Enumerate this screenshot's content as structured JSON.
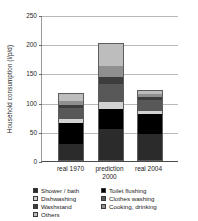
{
  "chart_data": {
    "type": "bar",
    "title": "",
    "subtitle": "",
    "xlabel": "",
    "ylabel": "Household consumption (l/p/d)",
    "categories": [
      "real 1970",
      "prediction 2000",
      "real 2004"
    ],
    "category_label_lines": [
      [
        "real 1970"
      ],
      [
        "prediction",
        "2000"
      ],
      [
        "real 2004"
      ]
    ],
    "ylim": [
      0,
      250
    ],
    "yticks": [
      0,
      50,
      100,
      150,
      200,
      250
    ],
    "ytick_labels": [
      "0",
      "50",
      "100",
      "150",
      "200",
      "250"
    ],
    "grid": true,
    "stacked": true,
    "legend_position": "bottom",
    "series": [
      {
        "name": "Shower / bath",
        "key": "shower",
        "color": "#2b2b2b",
        "values": [
          29,
          54,
          47
        ]
      },
      {
        "name": "Toilet flushing",
        "key": "toilet",
        "color": "#000000",
        "values": [
          36,
          35,
          34
        ]
      },
      {
        "name": "Dishwashing",
        "key": "dish",
        "color": "#d2d2d2",
        "values": [
          7,
          12,
          4
        ]
      },
      {
        "name": "Clothes washing",
        "key": "clothes",
        "color": "#585858",
        "values": [
          19,
          31,
          20
        ]
      },
      {
        "name": "Washstand",
        "key": "wash",
        "color": "#3d3d3d",
        "values": [
          5,
          12,
          5
        ]
      },
      {
        "name": "Cooking, drinking",
        "key": "cook",
        "color": "#8f8f8f",
        "values": [
          6,
          19,
          4
        ]
      },
      {
        "name": "Others",
        "key": "others",
        "color": "#bdbdbd",
        "values": [
          15,
          39,
          8
        ]
      }
    ],
    "totals": [
      117,
      202,
      122
    ]
  },
  "legend": {
    "column_left": [
      "Shower / bath",
      "Dishwashing",
      "Washstand",
      "Others"
    ],
    "column_right": [
      "Toilet flushing",
      "Clothes washing",
      "Cooking, drinking"
    ],
    "entries": [
      {
        "label": "Shower / bath",
        "key": "shower"
      },
      {
        "label": "Toilet flushing",
        "key": "toilet"
      },
      {
        "label": "Dishwashing",
        "key": "dish"
      },
      {
        "label": "Clothes washing",
        "key": "clothes"
      },
      {
        "label": "Washstand",
        "key": "wash"
      },
      {
        "label": "Cooking, drinking",
        "key": "cook"
      },
      {
        "label": "Others",
        "key": "others"
      }
    ]
  }
}
